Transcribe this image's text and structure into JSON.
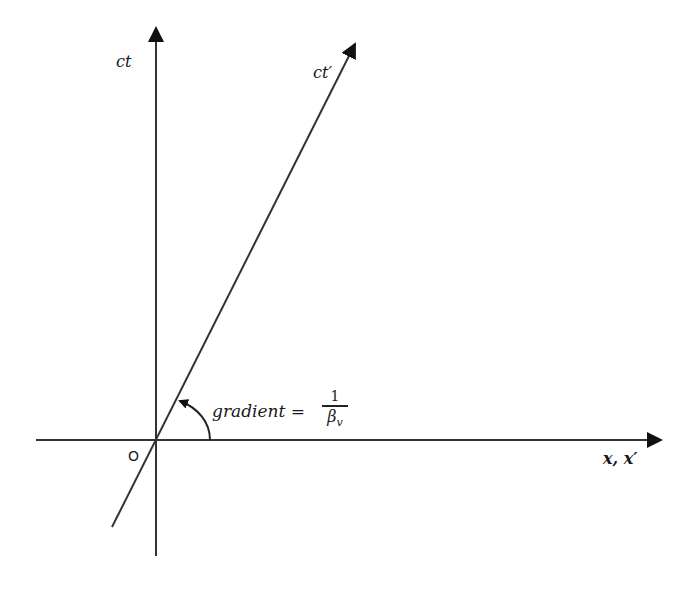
{
  "diagram": {
    "type": "spacetime-diagram",
    "axes": {
      "vertical_label": "ct",
      "primed_time_label": "ct′",
      "horizontal_label": "x, x′",
      "origin_label": "O"
    },
    "annotation": {
      "text": "gradient =",
      "fraction_numerator": "1",
      "fraction_denominator_symbol": "β",
      "fraction_denominator_subscript": "v"
    },
    "colors": {
      "line": "#222222",
      "background": "#ffffff"
    }
  }
}
